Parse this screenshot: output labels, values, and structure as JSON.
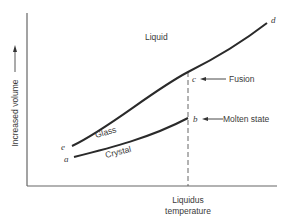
{
  "diagram": {
    "y_axis_label": "Increased volume",
    "x_axis_label_line1": "Liquidus",
    "x_axis_label_line2": "temperature",
    "region_labels": {
      "liquid": "Liquid",
      "glass": "Glass",
      "crystal": "Crystal"
    },
    "points": {
      "a": "a",
      "b": "b",
      "c": "c",
      "d": "d",
      "e": "e"
    },
    "annotations": {
      "fusion": "Fusion",
      "molten_state": "Molten state"
    },
    "colors": {
      "curve": "#2a2a2a",
      "axis": "#555555",
      "text": "#3a3a3a",
      "background": "#ffffff"
    }
  }
}
